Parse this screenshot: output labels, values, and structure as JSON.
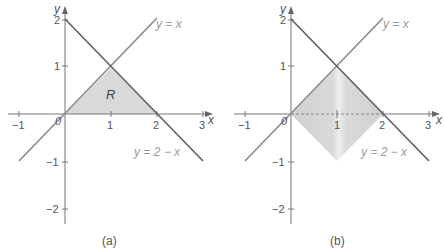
{
  "figure": {
    "panels": [
      {
        "id": "a",
        "caption": "(a)",
        "axes": {
          "x_label": "x",
          "y_label": "y",
          "x_ticks": [
            "−1",
            "0",
            "1",
            "2",
            "3"
          ],
          "y_ticks": [
            "2",
            "1",
            "−1",
            "−2"
          ],
          "origin_label": "0"
        },
        "lines": [
          {
            "name": "y-equals-x",
            "label": "y = x",
            "from": [
              -1,
              -1
            ],
            "to": [
              2,
              2
            ]
          },
          {
            "name": "y-equals-2-minus-x",
            "label": "y = 2 − x",
            "from": [
              0,
              2
            ],
            "to": [
              3,
              -1
            ]
          }
        ],
        "region": {
          "label": "R",
          "vertices": [
            [
              0,
              0
            ],
            [
              1,
              1
            ],
            [
              2,
              0
            ]
          ],
          "fill": "#d9d9d9"
        }
      },
      {
        "id": "b",
        "caption": "(b)",
        "axes": {
          "x_label": "x",
          "y_label": "y",
          "x_ticks": [
            "−1",
            "0",
            "1",
            "2",
            "3"
          ],
          "y_ticks": [
            "2",
            "1",
            "−1",
            "−2"
          ],
          "origin_label": "0"
        },
        "lines": [
          {
            "name": "y-equals-x",
            "label": "y = x",
            "from": [
              -1,
              -1
            ],
            "to": [
              2,
              2
            ]
          },
          {
            "name": "y-equals-2-minus-x",
            "label": "y = 2 − x",
            "from": [
              0,
              2
            ],
            "to": [
              3,
              -1
            ]
          }
        ],
        "solid": {
          "description": "region rotated about x-axis",
          "vertices": [
            [
              0,
              0
            ],
            [
              1,
              1
            ],
            [
              2,
              0
            ],
            [
              1,
              -1
            ]
          ],
          "fill": "#d6d6d6",
          "highlight": "#ececec"
        }
      }
    ],
    "colors": {
      "axis": "#777777",
      "line": "#6e6e6e",
      "region_fill": "#d9d9d9",
      "label_gray": "#9a9a9a"
    }
  }
}
